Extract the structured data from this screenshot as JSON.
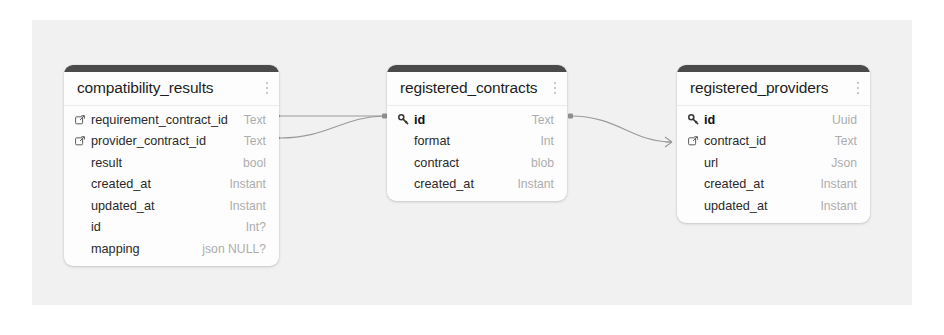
{
  "diagram": {
    "type": "entity-relationship-diagram",
    "canvas_background": "#f1f1f1",
    "accent_color": "#4a4a4a",
    "menu_icon": "kebab-menu-icon",
    "tables": [
      {
        "name": "compatibility_results",
        "columns": [
          {
            "name": "requirement_contract_id",
            "type": "Text",
            "icon": "foreign-key-icon"
          },
          {
            "name": "provider_contract_id",
            "type": "Text",
            "icon": "foreign-key-icon"
          },
          {
            "name": "result",
            "type": "bool",
            "icon": "none"
          },
          {
            "name": "created_at",
            "type": "Instant",
            "icon": "none"
          },
          {
            "name": "updated_at",
            "type": "Instant",
            "icon": "none"
          },
          {
            "name": "id",
            "type": "Int?",
            "icon": "none"
          },
          {
            "name": "mapping",
            "type": "json NULL?",
            "icon": "none"
          }
        ]
      },
      {
        "name": "registered_contracts",
        "columns": [
          {
            "name": "id",
            "type": "Text",
            "icon": "primary-key-icon"
          },
          {
            "name": "format",
            "type": "Int",
            "icon": "none"
          },
          {
            "name": "contract",
            "type": "blob",
            "icon": "none"
          },
          {
            "name": "created_at",
            "type": "Instant",
            "icon": "none"
          }
        ]
      },
      {
        "name": "registered_providers",
        "columns": [
          {
            "name": "id",
            "type": "Uuid",
            "icon": "primary-key-icon"
          },
          {
            "name": "contract_id",
            "type": "Text",
            "icon": "foreign-key-icon"
          },
          {
            "name": "url",
            "type": "Json",
            "icon": "none"
          },
          {
            "name": "created_at",
            "type": "Instant",
            "icon": "none"
          },
          {
            "name": "updated_at",
            "type": "Instant",
            "icon": "none"
          }
        ]
      }
    ],
    "relationships": [
      {
        "from_table": "compatibility_results",
        "from_column": "requirement_contract_id",
        "to_table": "registered_contracts",
        "to_column": "id"
      },
      {
        "from_table": "compatibility_results",
        "from_column": "provider_contract_id",
        "to_table": "registered_contracts",
        "to_column": "id"
      },
      {
        "from_table": "registered_contracts",
        "from_column": "id",
        "to_table": "registered_providers",
        "to_column": "contract_id"
      }
    ]
  }
}
